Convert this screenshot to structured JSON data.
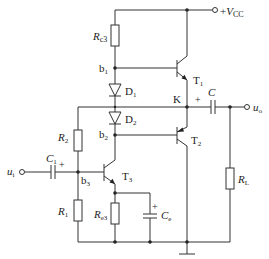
{
  "diagram": {
    "type": "circuit-schematic",
    "title": "",
    "supply": {
      "label_sign": "+",
      "label": "V",
      "label_sub": "CC"
    },
    "input": {
      "label": "u",
      "sub": "i"
    },
    "output": {
      "label": "u",
      "sub": "o"
    },
    "node_K": "K",
    "nodes": {
      "b1": {
        "label": "b",
        "sub": "1"
      },
      "b2": {
        "label": "b",
        "sub": "2"
      },
      "b3": {
        "label": "b",
        "sub": "3"
      }
    },
    "transistors": {
      "T1": {
        "label": "T",
        "sub": "1",
        "type": "NPN"
      },
      "T2": {
        "label": "T",
        "sub": "2",
        "type": "PNP"
      },
      "T3": {
        "label": "T",
        "sub": "3",
        "type": "NPN"
      }
    },
    "diodes": {
      "D1": {
        "label": "D",
        "sub": "1"
      },
      "D2": {
        "label": "D",
        "sub": "2"
      }
    },
    "resistors": {
      "Rc3": {
        "label": "R",
        "sub": "c3"
      },
      "R2": {
        "label": "R",
        "sub": "2"
      },
      "R1": {
        "label": "R",
        "sub": "1"
      },
      "Re3": {
        "label": "R",
        "sub": "e3"
      },
      "RL": {
        "label": "R",
        "sub": "L"
      }
    },
    "capacitors": {
      "C": {
        "label": "C",
        "sub": "",
        "polarity": "+"
      },
      "C1": {
        "label": "C",
        "sub": "1",
        "polarity": "+"
      },
      "Ce": {
        "label": "C",
        "sub": "e",
        "polarity": "+"
      }
    }
  }
}
